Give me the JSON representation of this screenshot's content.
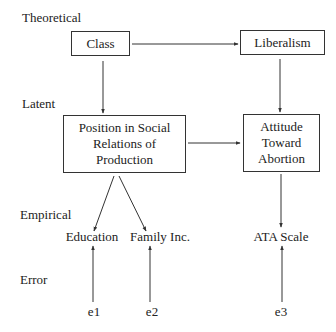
{
  "diagram": {
    "type": "path-model",
    "levels": {
      "theoretical": "Theoretical",
      "latent": "Latent",
      "empirical": "Empirical",
      "error": "Error"
    },
    "nodes": {
      "class": {
        "label": "Class",
        "level": "theoretical"
      },
      "liberalism": {
        "label": "Liberalism",
        "level": "theoretical"
      },
      "position": {
        "label": "Position in Social Relations of Production",
        "lines": [
          "Position in Social",
          "Relations of",
          "Production"
        ],
        "level": "latent"
      },
      "attitude": {
        "label": "Attitude Toward Abortion",
        "lines": [
          "Attitude",
          "Toward",
          "Abortion"
        ],
        "level": "latent"
      },
      "education": {
        "label": "Education",
        "level": "empirical"
      },
      "family_inc": {
        "label": "Family Inc.",
        "level": "empirical"
      },
      "ata_scale": {
        "label": "ATA Scale",
        "level": "empirical"
      },
      "e1": {
        "label": "e1",
        "level": "error"
      },
      "e2": {
        "label": "e2",
        "level": "error"
      },
      "e3": {
        "label": "e3",
        "level": "error"
      }
    },
    "edges": [
      {
        "from": "class",
        "to": "liberalism"
      },
      {
        "from": "class",
        "to": "position"
      },
      {
        "from": "liberalism",
        "to": "attitude"
      },
      {
        "from": "position",
        "to": "attitude"
      },
      {
        "from": "position",
        "to": "education"
      },
      {
        "from": "position",
        "to": "family_inc"
      },
      {
        "from": "attitude",
        "to": "ata_scale"
      },
      {
        "from": "e1",
        "to": "education"
      },
      {
        "from": "e2",
        "to": "family_inc"
      },
      {
        "from": "e3",
        "to": "ata_scale"
      }
    ],
    "colors": {
      "line": "#333333",
      "text": "#222222",
      "background": "#ffffff"
    }
  }
}
